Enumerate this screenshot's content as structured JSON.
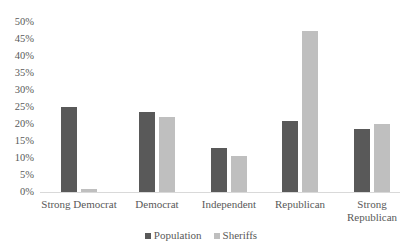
{
  "chart_data": {
    "type": "bar",
    "title": "",
    "xlabel": "",
    "ylabel": "",
    "ylim": [
      0,
      50
    ],
    "yticks": [
      "0%",
      "5%",
      "10%",
      "15%",
      "20%",
      "25%",
      "30%",
      "35%",
      "40%",
      "45%",
      "50%"
    ],
    "categories": [
      "Strong Democrat",
      "Democrat",
      "Independent",
      "Republican",
      "Strong Republican"
    ],
    "category_lines": [
      [
        "Strong Democrat"
      ],
      [
        "Democrat"
      ],
      [
        "Independent"
      ],
      [
        "Republican"
      ],
      [
        "Strong",
        "Republican"
      ]
    ],
    "series": [
      {
        "name": "Population",
        "color": "#595959",
        "values": [
          25,
          23.5,
          13,
          21,
          18.5
        ]
      },
      {
        "name": "Sheriffs",
        "color": "#bfbfbf",
        "values": [
          1,
          22,
          10.5,
          47.5,
          20
        ]
      }
    ],
    "grid": false,
    "legend_position": "bottom"
  }
}
